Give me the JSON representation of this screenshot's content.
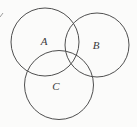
{
  "diagram": {
    "type": "venn-diagram",
    "colors": {
      "background": "#fbfbfa",
      "stroke": "#4f4f4f",
      "label_text": "#3a3a3a"
    },
    "circles": [
      {
        "label": "A",
        "cx": 45,
        "cy": 42,
        "r": 34,
        "label_x": 44,
        "label_y": 45
      },
      {
        "label": "B",
        "cx": 97,
        "cy": 45,
        "r": 32,
        "label_x": 96,
        "label_y": 49
      },
      {
        "label": "C",
        "cx": 59,
        "cy": 85,
        "r": 34.5,
        "label_x": 56,
        "label_y": 90
      }
    ],
    "artifacts": [
      {
        "name": "edge-mark",
        "x1": 0,
        "y1": 17,
        "x2": 3,
        "y2": 13
      }
    ]
  }
}
